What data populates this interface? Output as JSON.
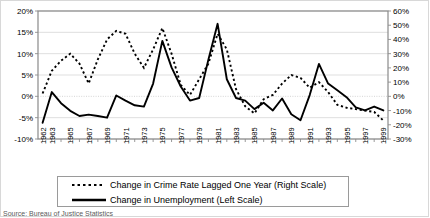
{
  "chart_data": {
    "type": "line",
    "title": "",
    "xlabel": "",
    "ylabel": "",
    "grid": true,
    "legend_position": "bottom",
    "x": [
      1962,
      1963,
      1964,
      1965,
      1966,
      1967,
      1968,
      1969,
      1970,
      1971,
      1972,
      1973,
      1974,
      1975,
      1976,
      1977,
      1978,
      1979,
      1980,
      1981,
      1982,
      1983,
      1984,
      1985,
      1986,
      1987,
      1988,
      1989,
      1990,
      1991,
      1992,
      1993,
      1994,
      1995,
      1996,
      1997,
      1998,
      1999
    ],
    "xtick_labels": [
      "1962",
      "1963",
      "1965",
      "1967",
      "1969",
      "1971",
      "1973",
      "1975",
      "1977",
      "1979",
      "1981",
      "1983",
      "1985",
      "1987",
      "1989",
      "1991",
      "1993",
      "1995",
      "1997",
      "1999"
    ],
    "left_axis": {
      "name": "Change in Unemployment (Left Scale)",
      "ticks": [
        "20%",
        "15%",
        "10%",
        "5%",
        "0%",
        "-5%",
        "-10%"
      ],
      "ylim": [
        -10,
        20
      ],
      "tick_step": 5,
      "unit": "%"
    },
    "right_axis": {
      "name": "Change in Crime Rate Lagged One Year (Right Scale)",
      "ticks": [
        "60%",
        "50%",
        "40%",
        "30%",
        "20%",
        "10%",
        "0%",
        "-10%",
        "-20%",
        "-30%"
      ],
      "ylim": [
        -30,
        60
      ],
      "tick_step": 10,
      "unit": "%"
    },
    "series": [
      {
        "name": "Change in Unemployment (Left Scale)",
        "axis": "left",
        "style": "solid",
        "color": "#000000",
        "values": [
          -6.2,
          1.0,
          -1.6,
          -3.4,
          -4.6,
          -4.3,
          -4.6,
          -5.0,
          0.2,
          -1.0,
          -2.1,
          -2.4,
          3.0,
          13.0,
          6.8,
          2.3,
          -1.0,
          -0.4,
          8.6,
          17.0,
          4.0,
          -0.4,
          -1.0,
          -3.0,
          -1.5,
          -3.3,
          -0.5,
          -4.2,
          -5.6,
          0.3,
          7.6,
          3.0,
          1.4,
          -0.2,
          -2.6,
          -3.3,
          -2.4,
          -3.3
        ]
      },
      {
        "name": "Change in Crime Rate Lagged One Year (Right Scale)",
        "axis": "right",
        "style": "dashed",
        "color": "#000000",
        "values": [
          2.0,
          18.0,
          25.0,
          30.0,
          23.0,
          9.0,
          26.0,
          40.0,
          46.0,
          44.0,
          30.0,
          20.0,
          33.0,
          48.0,
          30.0,
          8.0,
          1.0,
          12.0,
          23.0,
          44.0,
          33.0,
          5.0,
          -7.0,
          -12.0,
          -2.0,
          1.0,
          9.0,
          15.0,
          13.0,
          6.0,
          10.0,
          3.0,
          -6.0,
          -8.0,
          -9.0,
          -10.0,
          -11.0,
          -17.0
        ]
      }
    ],
    "legend": [
      {
        "label": "Change in Crime Rate Lagged One Year  (Right Scale)",
        "style": "dashed"
      },
      {
        "label": "Change in Unemployment (Left Scale)",
        "style": "solid"
      }
    ],
    "source_note": "Source: Bureau of Justice Statistics"
  }
}
